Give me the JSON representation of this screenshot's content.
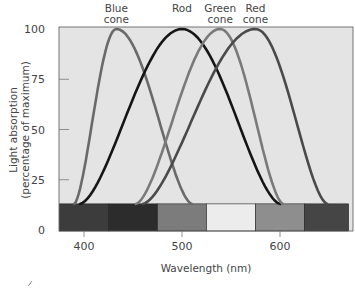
{
  "chart_data": {
    "type": "line",
    "title": "",
    "xlabel": "Wavelength (nm)",
    "ylabel": "Light absorption (percentage of maximum)",
    "ylabel_lines": [
      "Light absorption",
      "(percentage of maximum)"
    ],
    "xlim": [
      375,
      670
    ],
    "ylim": [
      0,
      100
    ],
    "xticks": [
      400,
      500,
      600
    ],
    "yticks": [
      0,
      25,
      50,
      75,
      100
    ],
    "grid": false,
    "legend_position": "curve labels above peaks",
    "series": [
      {
        "name": "Blue cone",
        "label_lines": [
          "Blue",
          "cone"
        ],
        "peak_nm": 433,
        "range_nm": [
          390,
          510
        ],
        "color": "#6a6a6a",
        "x": [
          390,
          410,
          433,
          455,
          480,
          510
        ],
        "y": [
          13,
          65,
          100,
          80,
          40,
          13
        ]
      },
      {
        "name": "Rod",
        "label_lines": [
          "Rod"
        ],
        "peak_nm": 500,
        "range_nm": [
          396,
          600
        ],
        "color": "#151515",
        "x": [
          396,
          440,
          470,
          500,
          530,
          560,
          600
        ],
        "y": [
          13,
          40,
          78,
          100,
          80,
          45,
          13
        ]
      },
      {
        "name": "Green cone",
        "label_lines": [
          "Green",
          "cone"
        ],
        "peak_nm": 539,
        "range_nm": [
          453,
          603
        ],
        "color": "#7a7a7a",
        "x": [
          453,
          490,
          515,
          539,
          565,
          585,
          603
        ],
        "y": [
          13,
          55,
          88,
          100,
          78,
          45,
          13
        ]
      },
      {
        "name": "Red cone",
        "label_lines": [
          "Red",
          "cone"
        ],
        "peak_nm": 575,
        "range_nm": [
          460,
          648
        ],
        "color": "#4a4a4a",
        "x": [
          460,
          500,
          540,
          575,
          605,
          630,
          648
        ],
        "y": [
          13,
          48,
          85,
          100,
          82,
          45,
          13
        ]
      }
    ],
    "spectrum_bar": {
      "y_range": [
        0,
        13
      ],
      "segments": [
        {
          "from_nm": 375,
          "to_nm": 425,
          "color": "#3c3c3c"
        },
        {
          "from_nm": 425,
          "to_nm": 475,
          "color": "#2c2c2c"
        },
        {
          "from_nm": 475,
          "to_nm": 525,
          "color": "#7c7c7c"
        },
        {
          "from_nm": 525,
          "to_nm": 575,
          "color": "#ececec"
        },
        {
          "from_nm": 575,
          "to_nm": 625,
          "color": "#8e8e8e"
        },
        {
          "from_nm": 625,
          "to_nm": 670,
          "color": "#454545"
        }
      ]
    }
  },
  "plot_background": "#e4e4e4"
}
